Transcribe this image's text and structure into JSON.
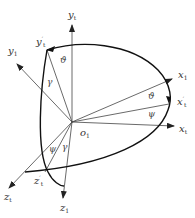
{
  "diagram": {
    "type": "coordinate-frame-rotation",
    "origin": {
      "label": "o",
      "sub": "1"
    },
    "axes": {
      "y_vertical": {
        "label": "y",
        "sub": "t"
      },
      "y_prime": {
        "label": "y",
        "prime": "′",
        "sub": "t"
      },
      "y_body": {
        "label": "y",
        "sub": "1"
      },
      "x_body": {
        "label": "x",
        "sub": "1"
      },
      "x_prime": {
        "label": "x",
        "prime": "′",
        "sub": "t"
      },
      "x_t": {
        "label": "x",
        "sub": "t"
      },
      "z_t": {
        "label": "z",
        "sub": "t"
      },
      "z_prime": {
        "label": "z",
        "prime": "′",
        "sub": "t"
      },
      "z_body": {
        "label": "z",
        "sub": "1"
      }
    },
    "angles": {
      "theta_top": "ϑ",
      "gamma_top": "γ",
      "theta_right": "ϑ",
      "psi_right": "ψ",
      "psi_bottom": "ψ",
      "gamma_bottom": "γ"
    },
    "colors": {
      "line": "#333333",
      "curve": "#111111",
      "background": "#ffffff"
    }
  }
}
